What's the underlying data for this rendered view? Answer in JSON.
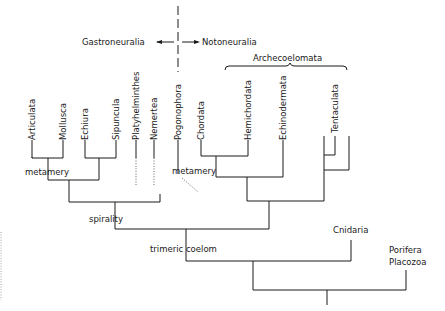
{
  "diagram": {
    "type": "cladogram",
    "header": {
      "left_group": "Gastroneuralia",
      "right_group": "Notoneuralia",
      "bracket_label": "Archecoelomata"
    },
    "taxa": [
      {
        "name": "Articulata"
      },
      {
        "name": "Mollusca"
      },
      {
        "name": "Echiura"
      },
      {
        "name": "Sipuncula"
      },
      {
        "name": "Platyhelminthes"
      },
      {
        "name": "Nemertea"
      },
      {
        "name": "Pogonophora"
      },
      {
        "name": "Chordata"
      },
      {
        "name": "Hemichordata"
      },
      {
        "name": "Echinodermata"
      },
      {
        "name": "Tentaculata"
      }
    ],
    "outgroups": [
      {
        "name": "Cnidaria"
      },
      {
        "name": "Porifera"
      },
      {
        "name": "Placozoa"
      }
    ],
    "characters": [
      {
        "label": "metamery",
        "position": "left"
      },
      {
        "label": "metamery",
        "position": "right"
      },
      {
        "label": "spirality"
      },
      {
        "label": "trimeric coelom"
      }
    ]
  }
}
